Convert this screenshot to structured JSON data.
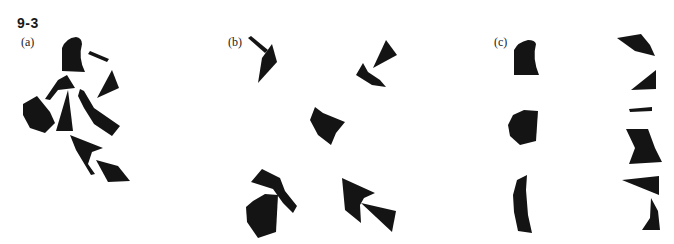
{
  "figure": {
    "number": "9-3",
    "fill_color": "#141414",
    "background": "#ffffff"
  },
  "panels": [
    {
      "id": "a",
      "label": "(a)",
      "arrangement": "assembled figure of 9 fragments"
    },
    {
      "id": "b",
      "label": "(b)",
      "arrangement": "fragments grouped in 5 clusters"
    },
    {
      "id": "c",
      "label": "(c)",
      "arrangement": "fragments in two vertical columns"
    }
  ]
}
